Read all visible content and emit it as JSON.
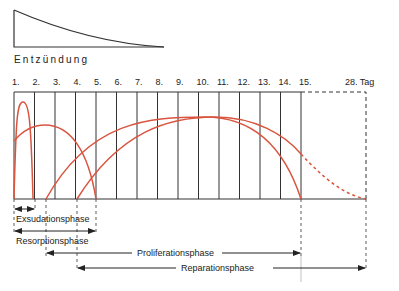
{
  "inflammation": {
    "label": "Entzündung"
  },
  "days": {
    "labels": [
      "1.",
      "2.",
      "3.",
      "4.",
      "5.",
      "6.",
      "7.",
      "8.",
      "9.",
      "10.",
      "11.",
      "12.",
      "13.",
      "14.",
      "15."
    ],
    "end_label": "28. Tag"
  },
  "phases": {
    "exsudation": "Exsudationsphase",
    "resorption": "Resorptionsphase",
    "proliferation": "Proliferationsphase",
    "reparation": "Reparationsphase"
  },
  "colors": {
    "curve": "#d9553f",
    "grid": "#333333"
  }
}
